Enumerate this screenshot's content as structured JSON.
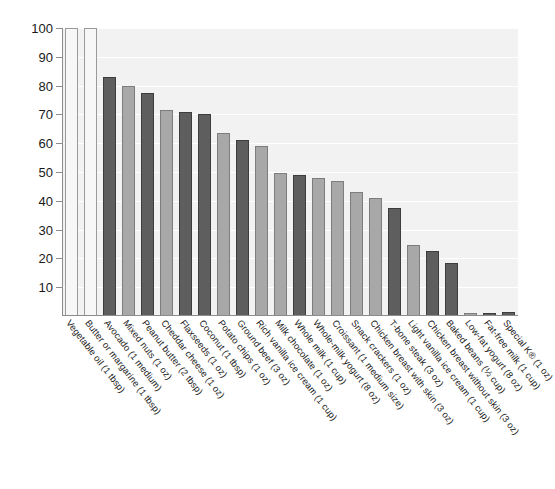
{
  "chart_data": {
    "type": "bar",
    "title": "",
    "xlabel": "",
    "ylabel": "Energy from fat (%)",
    "ylim": [
      0,
      100
    ],
    "ytick_labels": [
      "100",
      "90",
      "80",
      "70",
      "60",
      "50",
      "40",
      "30",
      "20",
      "10"
    ],
    "yticks": [
      100,
      90,
      80,
      70,
      60,
      50,
      40,
      30,
      20,
      10
    ],
    "grid": true,
    "legend": "none",
    "categories": [
      "Vegetable oil (1 tbsp)",
      "Butter or margarine (1 tbsp)",
      "Avocado (1 medium)",
      "Mixed nuts (1 oz)",
      "Peanut butter (2 tbsp)",
      "Cheddar cheese (1 oz)",
      "Flaxseeds (1 oz)",
      "Coconut (1 tbsp)",
      "Potato chips (1 oz)",
      "Ground beef (3 oz)",
      "Rich vanilla ice cream (1 cup)",
      "Milk chocolate (1 oz)",
      "Whole milk (1 cup)",
      "Whole-milk yogurt (8 oz)",
      "Croissant (1 medium size)",
      "Snack crackers (1 oz)",
      "Chicken breast with skin (3 oz)",
      "T-bone steak (3 oz)",
      "Light vanilla ice cream (1 cup)",
      "Chicken breast without skin (3 oz)",
      "Baked beans (½ cup)",
      "Low-fat yogurt (8 oz)",
      "Fat-free milk (1 cup)",
      "Special K® (1 oz)"
    ],
    "values": [
      100,
      100,
      83,
      80,
      77.5,
      71.5,
      71,
      70,
      63.5,
      61,
      59,
      49.5,
      49,
      48,
      47,
      43,
      41,
      37.5,
      24.5,
      22.5,
      18.5,
      1,
      1,
      1.5
    ],
    "bar_styles": [
      "open",
      "open",
      "dark",
      "light",
      "dark",
      "light",
      "dark",
      "dark",
      "light",
      "dark",
      "light",
      "light",
      "dark",
      "light",
      "light",
      "light",
      "light",
      "dark",
      "light",
      "dark",
      "dark",
      "light",
      "dark",
      "dark"
    ],
    "colors": {
      "plot_background": "#f2f2f2",
      "gridline": "#ffffff",
      "axis": "#8c8c8c",
      "bar_dark": "#5e5e5e",
      "bar_light": "#a8a8a8",
      "bar_open": "#f7f7f7",
      "text": "#1a1a1a"
    }
  }
}
